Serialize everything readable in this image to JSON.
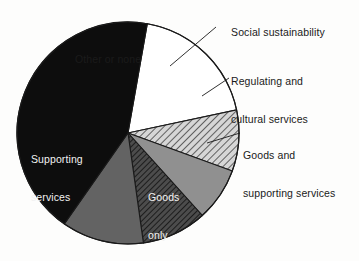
{
  "chart_data": {
    "type": "pie",
    "title": "",
    "subtitle": "",
    "xlabel": "",
    "ylabel": "",
    "grid": false,
    "legend_position": "none",
    "label_style": "direct-labels-with-leader-lines",
    "start_angle_deg": -80,
    "direction": "clockwise",
    "categories": [
      "Other or none",
      "Social sustainability",
      "Regulating and cultural services",
      "Goods and supporting services",
      "Goods only",
      "Supporting services"
    ],
    "values": [
      19,
      9,
      8,
      9,
      12,
      43
    ],
    "slices": [
      {
        "label": "Other or none",
        "value": 19,
        "start_deg": -80,
        "end_deg": -12,
        "fill": "#ffffff",
        "fill_style": "solid",
        "stroke": "#1a1a1a",
        "label_placement": "inside",
        "label_color": "#1b1b1b"
      },
      {
        "label": "Social sustainability",
        "value": 9,
        "start_deg": -12,
        "end_deg": 20,
        "fill": "#c9c9c9",
        "fill_style": "diagonal-hatch-light",
        "stroke": "#1a1a1a",
        "label_placement": "outside",
        "label_color": "#1a1a1a"
      },
      {
        "label": "Regulating and cultural services",
        "value": 8,
        "start_deg": 20,
        "end_deg": 48,
        "fill": "#909090",
        "fill_style": "solid",
        "stroke": "#1a1a1a",
        "label_placement": "outside",
        "label_color": "#1a1a1a"
      },
      {
        "label": "Goods and supporting services",
        "value": 9,
        "start_deg": 48,
        "end_deg": 82,
        "fill": "#5a5a5a",
        "fill_style": "diagonal-hatch-dark",
        "stroke": "#1a1a1a",
        "label_placement": "outside",
        "label_color": "#1a1a1a"
      },
      {
        "label": "Goods only",
        "value": 12,
        "start_deg": 82,
        "end_deg": 125,
        "fill": "#636363",
        "fill_style": "solid",
        "stroke": "#1a1a1a",
        "label_placement": "inside",
        "label_color": "#f2f2f2"
      },
      {
        "label": "Supporting services",
        "value": 43,
        "start_deg": 125,
        "end_deg": 280,
        "fill": "#0d0d0d",
        "fill_style": "solid",
        "stroke": "#1a1a1a",
        "label_placement": "inside",
        "label_color": "#f2f2f2"
      }
    ]
  },
  "labels": {
    "social_sustainability": "Social sustainability",
    "regulating_line1": "Regulating and",
    "regulating_line2": "cultural services",
    "goods_supporting_line1": "Goods and",
    "goods_supporting_line2": "supporting services",
    "other_or_none": "Other or none",
    "supporting_line1": "Supporting",
    "supporting_line2": "services",
    "goods_only_line1": "Goods",
    "goods_only_line2": "only"
  }
}
